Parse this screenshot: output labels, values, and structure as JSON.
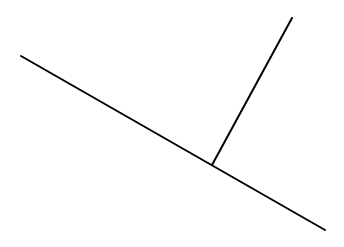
{
  "diagram": {
    "background": "#ffffff",
    "stroke_color": "#000000",
    "stroke_width": 2,
    "segments": [
      {
        "id": "base-line",
        "x1": 21,
        "y1": 56,
        "x2": 325,
        "y2": 230
      },
      {
        "id": "perpendicular-line",
        "x1": 212,
        "y1": 165,
        "x2": 292,
        "y2": 18
      }
    ]
  }
}
